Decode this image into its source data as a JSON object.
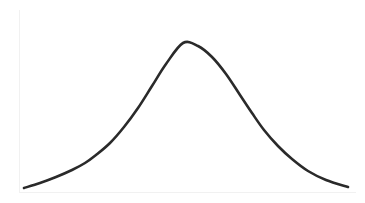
{
  "chart_data": {
    "type": "line",
    "title": "",
    "subtitle": "",
    "xlabel": "",
    "ylabel": "",
    "description": "Symmetric bell-shaped normal distribution curve",
    "grid": false,
    "legend": false,
    "legend_position": "none",
    "axes_visible": {
      "left_rule": true,
      "bottom_rule": true,
      "ticks": false,
      "tick_labels": false
    },
    "xlim": [
      0,
      365
    ],
    "ylim": [
      0,
      203
    ],
    "series": [
      {
        "name": "normal-distribution",
        "color": "#2a2a2a",
        "stroke_width": 2.6,
        "x": [
          24,
          40,
          56,
          72,
          85,
          96,
          110,
          124,
          138,
          152,
          166,
          183,
          198,
          212,
          226,
          240,
          252,
          264,
          278,
          292,
          308,
          326,
          348
        ],
        "y": [
          188,
          183,
          177,
          170,
          163,
          155,
          143,
          127,
          108,
          86,
          64,
          43,
          46,
          57,
          74,
          95,
          113,
          130,
          146,
          159,
          171,
          180,
          187
        ]
      }
    ],
    "curve_geometry": {
      "start_point": [
        24,
        188
      ],
      "peak_point": [
        183,
        43
      ],
      "end_point": [
        348,
        187
      ],
      "left_inflection": [
        110,
        143
      ],
      "right_inflection": [
        252,
        113
      ],
      "smoothing": "cubic-bezier"
    },
    "colors": {
      "background": "#ffffff",
      "stroke": "#2a2a2a",
      "axis_rule": "#f1f1f1"
    }
  }
}
